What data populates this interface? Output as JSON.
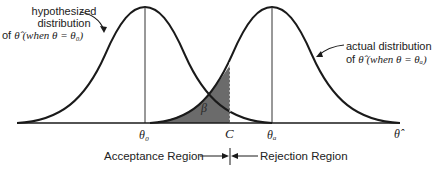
{
  "figure": {
    "type": "hypothesis-test-distributions",
    "left_annotation": {
      "line1": "hypothesized",
      "line2": "distribution",
      "line3_prefix": "of ",
      "estimator": "θ̂",
      "line3_suffix": " (when θ = θ₀)"
    },
    "right_annotation": {
      "line1": "actual distribution",
      "line2_prefix": "of ",
      "estimator": "θ̂",
      "line2_suffix": " (when θ = θₐ)"
    },
    "shaded_region_label": "β",
    "axis_ticks": {
      "theta0": "θ₀",
      "critical": "C",
      "thetaA": "θₐ",
      "axis_end": "θ̂"
    },
    "regions": {
      "acceptance": "Acceptance Region",
      "rejection": "Rejection Region"
    },
    "colors": {
      "curve": "#1a1a1a",
      "shade": "#6b6b6b",
      "axis": "#1a1a1a"
    }
  }
}
